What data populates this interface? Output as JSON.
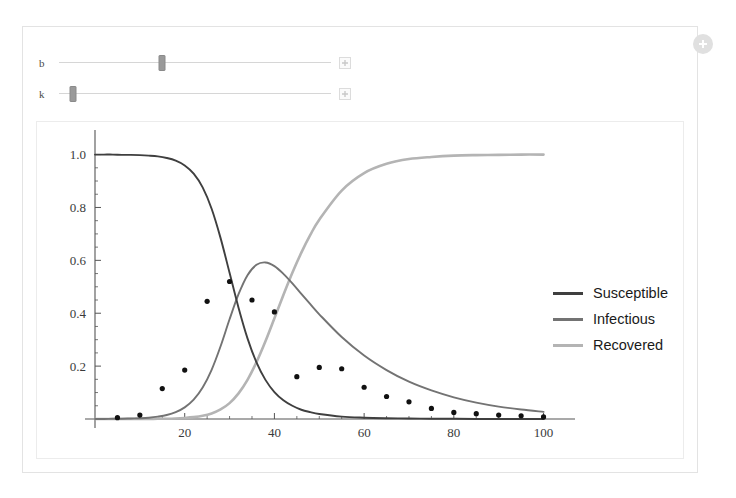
{
  "panel": {
    "plus_badge_icon": "plus-circle-icon"
  },
  "controls": [
    {
      "label": "b",
      "handle_percent": 38,
      "plus_icon": "plus-box-icon",
      "name": "slider-b"
    },
    {
      "label": "k",
      "handle_percent": 5,
      "plus_icon": "plus-box-icon",
      "name": "slider-k"
    }
  ],
  "legend": {
    "items": [
      {
        "label": "Susceptible",
        "color": "#3f3f3f"
      },
      {
        "label": "Infectious",
        "color": "#737373"
      },
      {
        "label": "Recovered",
        "color": "#b4b4b4"
      }
    ]
  },
  "colors": {
    "susceptible": "#3f3f3f",
    "infectious": "#737373",
    "recovered": "#b4b4b4",
    "axis": "#555555",
    "points": "#111111",
    "panel_border": "#e3e3e3",
    "plot_border": "#ececec",
    "slider_track": "#d6d6d6",
    "slider_handle": "#9a9a9a"
  },
  "chart_data": {
    "type": "line",
    "title": "",
    "xlabel": "",
    "ylabel": "",
    "xlim": [
      0,
      103
    ],
    "ylim": [
      0,
      1.04
    ],
    "grid": false,
    "legend_position": "right",
    "xticks": [
      20,
      40,
      60,
      80,
      100
    ],
    "yticks": [
      0.2,
      0.4,
      0.6,
      0.8,
      1.0
    ],
    "xminor_step": 5,
    "yminor_step": 0.05,
    "x": [
      0,
      2,
      4,
      6,
      8,
      10,
      12,
      14,
      16,
      18,
      20,
      22,
      24,
      26,
      28,
      30,
      32,
      34,
      36,
      38,
      40,
      42,
      44,
      46,
      48,
      50,
      55,
      60,
      65,
      70,
      75,
      80,
      85,
      90,
      95,
      100
    ],
    "series": [
      {
        "name": "Susceptible",
        "color": "#3f3f3f",
        "values": [
          1.0,
          1.0,
          1.0,
          0.999,
          0.999,
          0.998,
          0.996,
          0.993,
          0.987,
          0.977,
          0.959,
          0.928,
          0.876,
          0.795,
          0.684,
          0.553,
          0.421,
          0.305,
          0.214,
          0.148,
          0.102,
          0.071,
          0.05,
          0.035,
          0.026,
          0.019,
          0.009,
          0.005,
          0.003,
          0.002,
          0.001,
          0.001,
          0.0,
          0.0,
          0.0,
          0.0
        ]
      },
      {
        "name": "Infectious",
        "color": "#737373",
        "values": [
          0.0,
          0.0,
          0.001,
          0.001,
          0.002,
          0.003,
          0.005,
          0.009,
          0.015,
          0.026,
          0.044,
          0.073,
          0.119,
          0.186,
          0.275,
          0.377,
          0.472,
          0.544,
          0.583,
          0.592,
          0.578,
          0.549,
          0.513,
          0.473,
          0.434,
          0.396,
          0.31,
          0.24,
          0.185,
          0.141,
          0.108,
          0.082,
          0.062,
          0.047,
          0.036,
          0.027
        ]
      },
      {
        "name": "Recovered",
        "color": "#b4b4b4",
        "values": [
          0.0,
          0.0,
          0.0,
          0.0,
          0.0,
          0.0,
          0.0,
          0.001,
          0.001,
          0.002,
          0.004,
          0.007,
          0.012,
          0.021,
          0.036,
          0.06,
          0.097,
          0.148,
          0.215,
          0.294,
          0.381,
          0.469,
          0.553,
          0.629,
          0.696,
          0.754,
          0.864,
          0.93,
          0.965,
          0.983,
          0.991,
          0.996,
          0.998,
          0.999,
          1.0,
          1.0
        ]
      }
    ],
    "scatter": {
      "name": "Observed infectious",
      "color": "#111111",
      "points": [
        [
          5,
          0.005
        ],
        [
          10,
          0.015
        ],
        [
          15,
          0.115
        ],
        [
          20,
          0.185
        ],
        [
          25,
          0.445
        ],
        [
          30,
          0.52
        ],
        [
          35,
          0.45
        ],
        [
          40,
          0.405
        ],
        [
          45,
          0.16
        ],
        [
          50,
          0.195
        ],
        [
          55,
          0.19
        ],
        [
          60,
          0.12
        ],
        [
          65,
          0.085
        ],
        [
          70,
          0.065
        ],
        [
          75,
          0.04
        ],
        [
          80,
          0.025
        ],
        [
          85,
          0.02
        ],
        [
          90,
          0.015
        ],
        [
          95,
          0.012
        ],
        [
          100,
          0.008
        ]
      ]
    }
  }
}
